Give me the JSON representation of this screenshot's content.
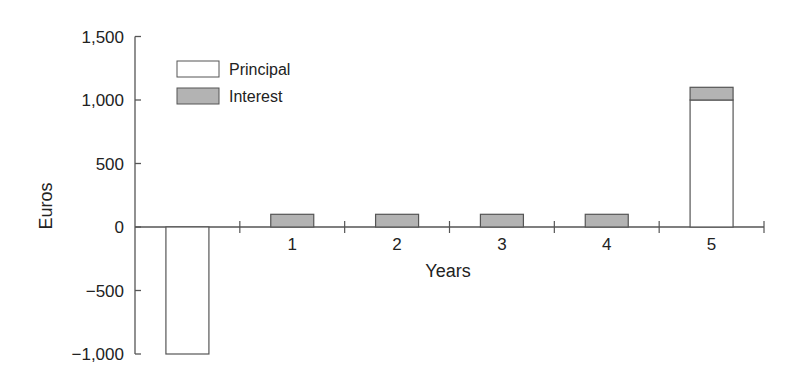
{
  "chart_data": {
    "type": "bar",
    "stacked": true,
    "title": "",
    "xlabel": "Years",
    "ylabel": "Euros",
    "categories": [
      "0",
      "1",
      "2",
      "3",
      "4",
      "5"
    ],
    "series": [
      {
        "name": "Principal",
        "color": "#ffffff",
        "values": [
          -1000,
          0,
          0,
          0,
          0,
          1000
        ]
      },
      {
        "name": "Interest",
        "color": "#b3b3b3",
        "values": [
          0,
          100,
          100,
          100,
          100,
          100
        ]
      }
    ],
    "ylim": [
      -1000,
      1500
    ],
    "yticks": [
      -1000,
      -500,
      0,
      500,
      1000,
      1500
    ],
    "ytick_labels": [
      "−1,000",
      "−500",
      "0",
      "500",
      "1,000",
      "1,500"
    ],
    "grid": false,
    "legend_position": "upper left"
  },
  "legend": {
    "principal": "Principal",
    "interest": "Interest"
  },
  "axes": {
    "xlabel": "Years",
    "ylabel": "Euros"
  }
}
